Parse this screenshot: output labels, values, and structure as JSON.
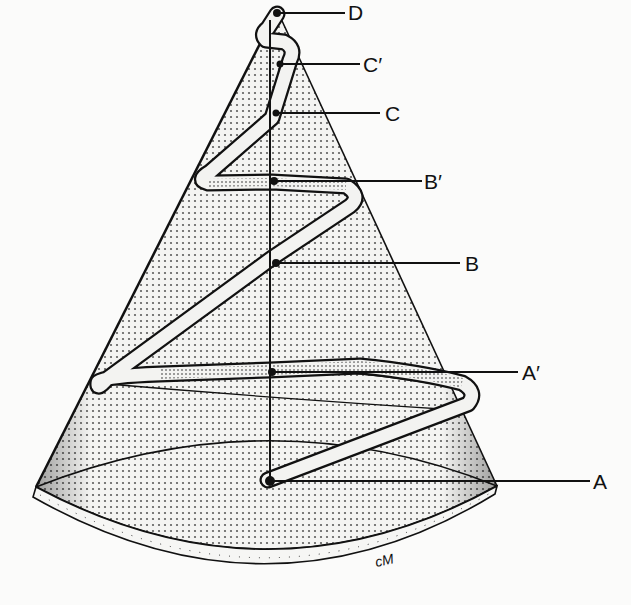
{
  "figure": {
    "labels": {
      "D": "D",
      "C_prime": "C′",
      "C": "C",
      "B_prime": "B′",
      "B": "B",
      "A_prime": "A′",
      "A": "A"
    },
    "signature": "cM",
    "colors": {
      "ink": "#111111",
      "stipple": "#2a2a2a",
      "band": "#f3f3f1",
      "paper": "#fbfbfa"
    }
  }
}
